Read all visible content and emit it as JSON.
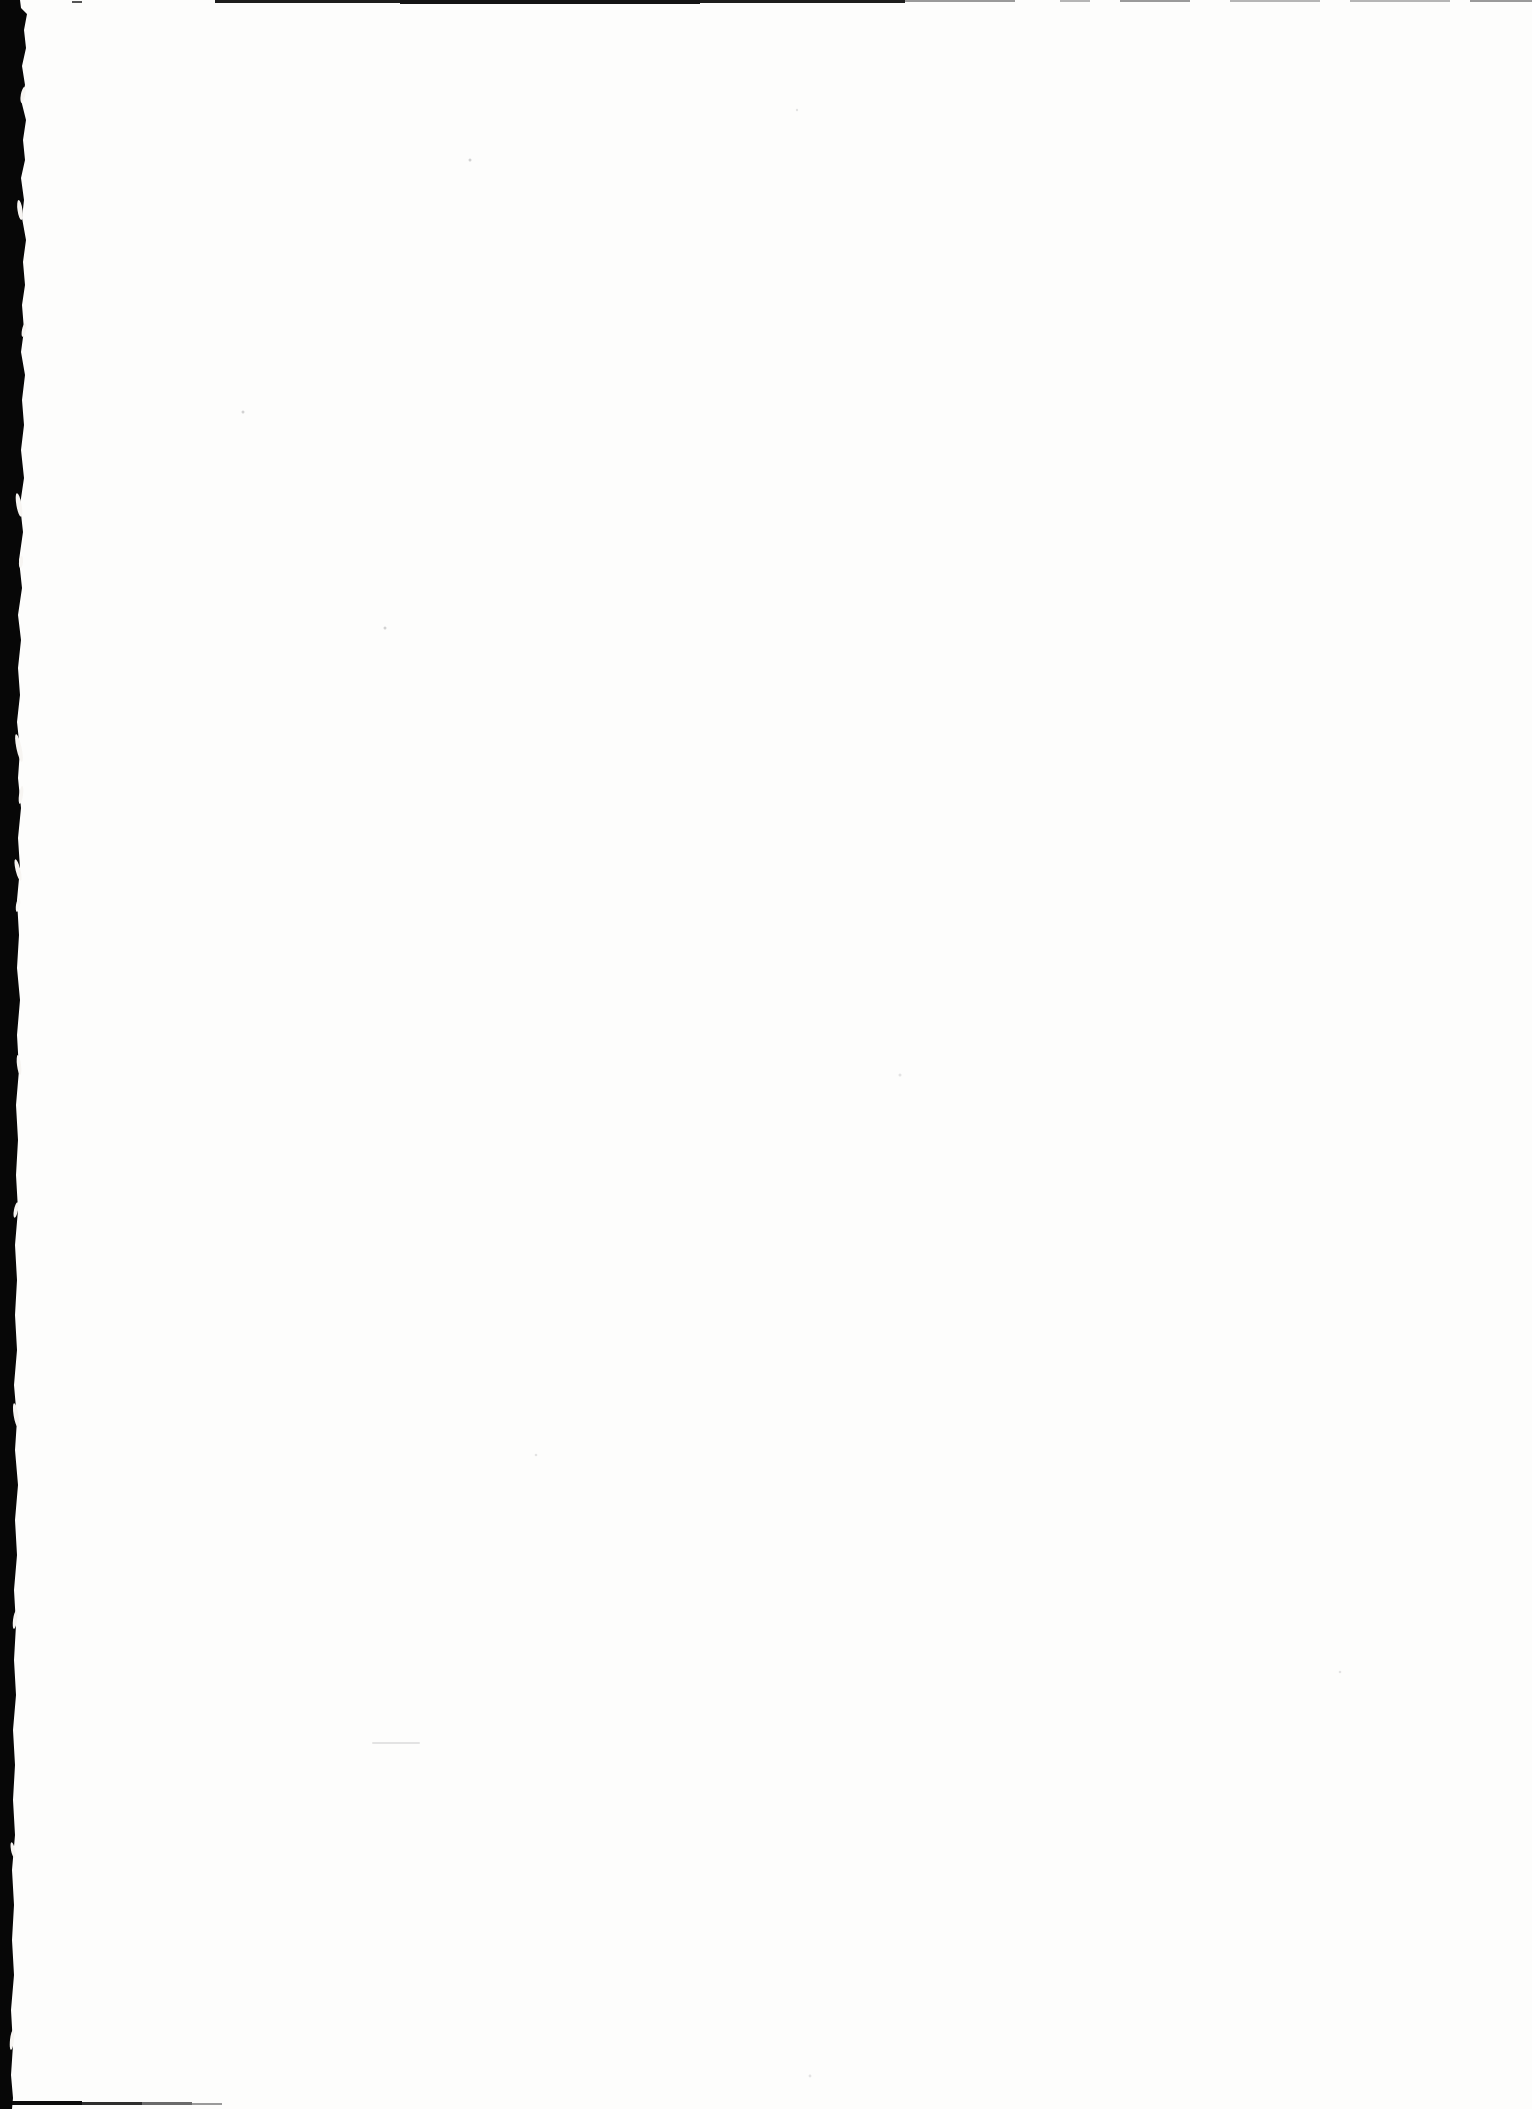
{
  "page": {
    "kind": "blank-scanned-book-page",
    "visible_text": ""
  },
  "colors": {
    "paper": "#fdfdfc",
    "gutter_black": "#070707",
    "top_edge_dark": "#1d1d1d",
    "top_edge_darker": "#141414",
    "top_edge_mid": "#555555",
    "top_edge_gray": "#9a9a9a",
    "top_edge_light": "#b5b5b5",
    "bottom_edge_black": "#0c0c0c",
    "bottom_edge_dark": "#2e2e2e",
    "bottom_edge_mid": "#6a6a6a",
    "bottom_edge_light": "#9a9a9a",
    "fleck_white": "#f7f5f2",
    "speck_gray": "#d2d2d2",
    "speck_faint": "#e3e3e3"
  }
}
